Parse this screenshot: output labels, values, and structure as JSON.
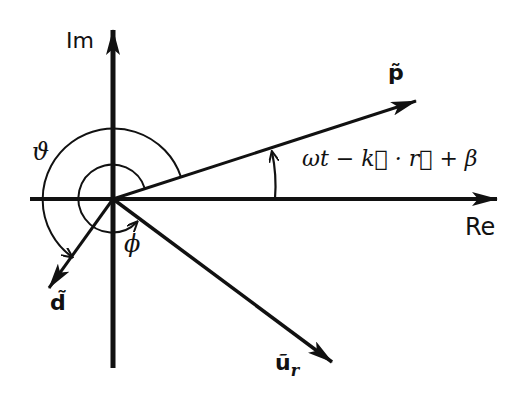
{
  "diagram": {
    "type": "phasor-diagram",
    "colors": {
      "ink": "#111111",
      "background": "#ffffff"
    },
    "axes": {
      "imaginary_label": "Im",
      "real_label": "Re"
    },
    "vectors": [
      {
        "id": "p",
        "label": "p̃",
        "direction": "upper-right"
      },
      {
        "id": "u_r",
        "label": "ũ",
        "subscript": "r",
        "direction": "lower-right"
      },
      {
        "id": "d",
        "label": "d̃",
        "direction": "lower-left"
      }
    ],
    "angles": {
      "phase_p": "ωt − k⃗ · r⃗ + β",
      "theta": "ϑ",
      "phi": "ϕ"
    }
  }
}
